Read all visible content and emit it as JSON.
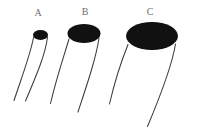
{
  "figure": {
    "background_color": "#ffffff",
    "ink_color": "#111111",
    "line_color": "#3b3b3b",
    "label_color": "#6e6e6e",
    "width": 197,
    "height": 129,
    "caption": ""
  },
  "panels": [
    {
      "id": "a",
      "label": "A",
      "label_x": 38,
      "label_y": 8,
      "bell": {
        "name": "bell-a",
        "center_x": 40.5,
        "center_y": 35.0,
        "radius_x": 7.5,
        "radius_y": 5.0
      },
      "tentacles": [
        {
          "name": "tentacle-a-left",
          "path": "M 33.5 37.5 C 30.5 54 23.5 72 14.0 100.5"
        },
        {
          "name": "tentacle-a-right",
          "path": "M 47.5 37.0 C 45.5 54 37.0 74 25.5 101.0"
        }
      ]
    },
    {
      "id": "b",
      "label": "B",
      "label_x": 85,
      "label_y": 7,
      "bell": {
        "name": "bell-b",
        "center_x": 84.0,
        "center_y": 33.5,
        "radius_x": 16.5,
        "radius_y": 9.5
      },
      "tentacles": [
        {
          "name": "tentacle-b-left",
          "path": "M 69.0 39.0 C 64.0 56 57.0 76 50.5 103.5"
        },
        {
          "name": "tentacle-b-right",
          "path": "M 99.0 38.0 C 96.0 58 88.5 80 78.0 112.0"
        }
      ]
    },
    {
      "id": "c",
      "label": "C",
      "label_x": 150,
      "label_y": 7,
      "bell": {
        "name": "bell-c",
        "center_x": 152.0,
        "center_y": 36.0,
        "radius_x": 26.0,
        "radius_y": 14.0
      },
      "tentacles": [
        {
          "name": "tentacle-c-left",
          "path": "M 128.0 44.5 C 121.0 62 115.0 80 109.5 104.0"
        },
        {
          "name": "tentacle-c-right",
          "path": "M 175.5 44.0 C 172.0 66 162.0 92 147.5 126.5"
        }
      ]
    }
  ]
}
